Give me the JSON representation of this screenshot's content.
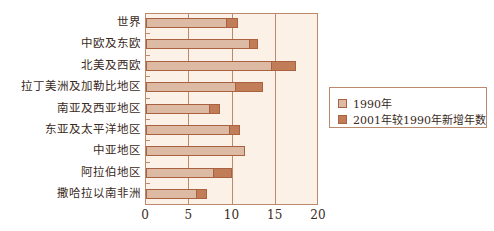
{
  "chart_data": {
    "type": "bar",
    "orientation": "horizontal",
    "stacked": true,
    "title": "",
    "xlabel": "",
    "ylabel": "",
    "xlim": [
      0,
      20
    ],
    "xticks": [
      0,
      5,
      10,
      15,
      20
    ],
    "grid": "vertical",
    "legend_position": "right",
    "categories": [
      "世界",
      "中欧及东欧",
      "北美及西欧",
      "拉丁美洲及加勒比地区",
      "南亚及西亚地区",
      "东亚及太平洋地区",
      "中亚地区",
      "阿拉伯地区",
      "撒哈拉以南非洲"
    ],
    "series": [
      {
        "name": "1990年",
        "color": "#dcbaa3",
        "values": [
          9.4,
          12.0,
          14.6,
          10.4,
          7.4,
          9.7,
          11.4,
          7.9,
          5.9
        ]
      },
      {
        "name": "2001年较1990年新增年数",
        "color": "#c17d58",
        "values": [
          1.2,
          0.9,
          2.7,
          3.1,
          1.1,
          1.2,
          0.0,
          2.1,
          1.1
        ]
      }
    ]
  },
  "legend": {
    "items": [
      {
        "label": "1990年",
        "color": "#dcbaa3"
      },
      {
        "label": "2001年较1990年新增年数",
        "color": "#c17d58"
      }
    ]
  }
}
